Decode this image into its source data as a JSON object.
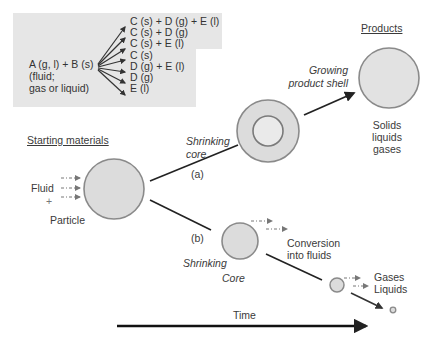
{
  "colors": {
    "box_bg": "#e6e6e6",
    "circle_fill": "#dcdcdc",
    "circle_stroke": "#8a8a8a",
    "line": "#222222",
    "fluid_arrow": "#777777"
  },
  "reaction_box": {
    "reactants": [
      "A (g, l) + B (s)",
      "(fluid;",
      "gas or liquid)"
    ],
    "products": [
      "C (s) + D (g) + E (l)",
      "C (s) + D (g)",
      "C (s) + E (l)",
      "C (s)",
      "D (g) + E (l)",
      "D (g)",
      "E (l)"
    ]
  },
  "labels": {
    "starting_materials": "Starting materials",
    "fluid": "Fluid",
    "plus": "+",
    "particle": "Particle",
    "path_a": "(a)",
    "path_b": "(b)",
    "shrinking_core_a_1": "Shrinking",
    "shrinking_core_a_2": "core",
    "growing_shell_1": "Growing",
    "growing_shell_2": "product shell",
    "products_heading": "Products",
    "products_1": "Solids",
    "products_2": "liquids",
    "products_3": "gases",
    "shrinking_core_b_1": "Shrinking",
    "shrinking_core_b_2": "Core",
    "conversion_1": "Conversion",
    "conversion_2": "into fluids",
    "gases": "Gases",
    "liquids": "Liquids",
    "time": "Time"
  }
}
